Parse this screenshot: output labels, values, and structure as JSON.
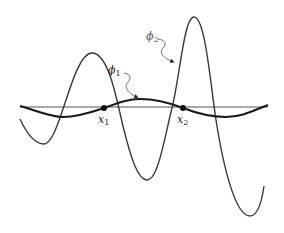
{
  "diagram": {
    "axis": {
      "x1": 20,
      "x2": 268,
      "y": 107,
      "color": "#555555"
    },
    "curves": [
      {
        "name": "phi_1",
        "label": "ϕ",
        "subscript": "1",
        "stroke": "#1a1a1a",
        "width": 2.2,
        "path": "M20,106 C35,110 50,117 63,117 C78,117 92,112 104,108 C118,103 128,99 140,99 C155,99 170,103 183,108 C196,113 210,117 226,117 C242,117 255,110 268,105"
      },
      {
        "name": "phi_2",
        "label": "ϕ",
        "subscript": "2",
        "stroke": "#3a3a3a",
        "width": 1.4,
        "path": "M20,119 C26,132 34,144 44,144 C60,144 72,53 92,53 C110,53 118,108 124,130 C131,158 138,180 147,180 C158,180 164,140 172,108 C180,76 184,17 194,17 C205,17 210,80 216,120 C223,165 235,216 250,216 C258,216 262,200 264,186"
      }
    ],
    "points": [
      {
        "name": "x1",
        "cx": 104,
        "cy": 108,
        "label": "x",
        "subscript": "1",
        "lx": 98,
        "ly": 114
      },
      {
        "name": "x2",
        "cx": 183,
        "cy": 108,
        "label": "x",
        "subscript": "2",
        "lx": 177,
        "ly": 114
      }
    ],
    "annotations": [
      {
        "target": "phi_1",
        "label": "ϕ",
        "subscript": "1",
        "lx": 108,
        "ly": 65,
        "leader": "M124,73 C130,74 132,78 128,82 C124,86 126,92 138,98"
      },
      {
        "target": "phi_2",
        "label": "ϕ",
        "subscript": "2",
        "lx": 146,
        "ly": 31,
        "leader": "M158,39 C165,40 167,44 163,48 C159,52 162,58 174,62"
      }
    ]
  }
}
